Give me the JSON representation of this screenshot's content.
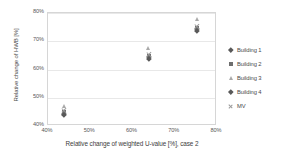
{
  "chart_data": {
    "type": "scatter",
    "title": "",
    "xlabel": "Relative change of weighted U-value [%], case 2",
    "ylabel": "Relative change of HWB [%]",
    "xlim": [
      40,
      80
    ],
    "ylim": [
      40,
      80
    ],
    "xticks": [
      "40%",
      "50%",
      "60%",
      "70%",
      "80%"
    ],
    "yticks": [
      "40%",
      "50%",
      "60%",
      "70%",
      "80%"
    ],
    "xtick_values": [
      40,
      50,
      60,
      70,
      80
    ],
    "ytick_values": [
      40,
      50,
      60,
      70,
      80
    ],
    "grid": "horizontal",
    "legend_position": "right",
    "series": [
      {
        "name": "Building 1",
        "marker": "diamond",
        "color": "#595959",
        "points": [
          {
            "x": 43.8,
            "y": 44.4
          },
          {
            "x": 63.8,
            "y": 64.4
          },
          {
            "x": 75.3,
            "y": 74.3
          }
        ]
      },
      {
        "name": "Building 2",
        "marker": "square",
        "color": "#6e6e6e",
        "points": [
          {
            "x": 43.8,
            "y": 45.0
          },
          {
            "x": 63.8,
            "y": 65.0
          },
          {
            "x": 75.3,
            "y": 74.9
          }
        ]
      },
      {
        "name": "Building 3",
        "marker": "triangle",
        "color": "#a9a9a9",
        "points": [
          {
            "x": 43.8,
            "y": 47.2
          },
          {
            "x": 63.8,
            "y": 67.7
          },
          {
            "x": 75.3,
            "y": 78.0
          }
        ]
      },
      {
        "name": "Building 4",
        "marker": "diamond",
        "color": "#595959",
        "points": [
          {
            "x": 43.8,
            "y": 44.0
          },
          {
            "x": 63.8,
            "y": 63.8
          },
          {
            "x": 75.3,
            "y": 73.5
          }
        ]
      },
      {
        "name": "MV",
        "marker": "x",
        "color": "#9a9a9a",
        "points": [
          {
            "x": 43.8,
            "y": 45.4
          },
          {
            "x": 63.8,
            "y": 65.4
          },
          {
            "x": 75.3,
            "y": 75.4
          }
        ]
      }
    ]
  },
  "legend": {
    "items": [
      {
        "label": "Building 1",
        "marker": "diamond"
      },
      {
        "label": "Building 2",
        "marker": "square"
      },
      {
        "label": "Building 3",
        "marker": "triangle"
      },
      {
        "label": "Building 4",
        "marker": "diamond"
      },
      {
        "label": "MV",
        "marker": "x"
      }
    ]
  }
}
